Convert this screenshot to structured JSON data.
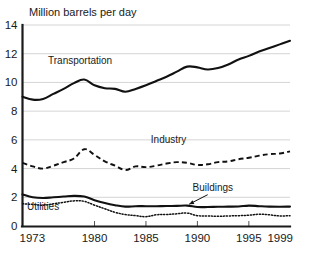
{
  "chart_data": {
    "type": "line",
    "title": "Million barrels per day",
    "xlabel": "",
    "ylabel": "Million barrels per day",
    "xlim": [
      1973,
      1999
    ],
    "ylim": [
      0,
      14
    ],
    "grid": true,
    "legend_position": "inline-annotations",
    "y_ticks": [
      "0",
      "2",
      "4",
      "6",
      "8",
      "10",
      "12",
      "14"
    ],
    "y_tick_values": [
      0,
      2,
      4,
      6,
      8,
      10,
      12,
      14
    ],
    "x_ticks": [
      "1973",
      "1980",
      "1985",
      "1990",
      "1995",
      "1999"
    ],
    "x_tick_values": [
      1973,
      1980,
      1985,
      1990,
      1995,
      1999
    ],
    "x": [
      1973,
      1974,
      1975,
      1976,
      1977,
      1978,
      1979,
      1980,
      1981,
      1982,
      1983,
      1984,
      1985,
      1986,
      1987,
      1988,
      1989,
      1990,
      1991,
      1992,
      1993,
      1994,
      1995,
      1996,
      1997,
      1998,
      1999
    ],
    "series": [
      {
        "name": "Transportation",
        "style": "solid",
        "label_x": 1978.6,
        "label_y": 11.25,
        "values": [
          9.0,
          8.8,
          8.85,
          9.2,
          9.55,
          9.95,
          10.2,
          9.8,
          9.6,
          9.55,
          9.35,
          9.55,
          9.8,
          10.1,
          10.4,
          10.75,
          11.1,
          11.05,
          10.9,
          11.0,
          11.25,
          11.6,
          11.85,
          12.15,
          12.4,
          12.65,
          12.9
        ]
      },
      {
        "name": "Industry",
        "style": "dashed",
        "label_x": 1987.2,
        "label_y": 5.75,
        "values": [
          4.4,
          4.15,
          4.0,
          4.2,
          4.45,
          4.7,
          5.35,
          4.95,
          4.5,
          4.2,
          3.9,
          4.15,
          4.1,
          4.2,
          4.35,
          4.45,
          4.4,
          4.25,
          4.3,
          4.45,
          4.5,
          4.65,
          4.75,
          4.9,
          5.0,
          5.05,
          5.2
        ]
      },
      {
        "name": "Buildings",
        "style": "solid",
        "label_x": 1991.5,
        "label_y": 2.45,
        "values": [
          2.2,
          2.0,
          1.95,
          2.0,
          2.05,
          2.1,
          2.05,
          1.8,
          1.6,
          1.45,
          1.35,
          1.38,
          1.38,
          1.38,
          1.39,
          1.4,
          1.42,
          1.32,
          1.32,
          1.34,
          1.35,
          1.36,
          1.42,
          1.38,
          1.35,
          1.34,
          1.35
        ]
      },
      {
        "name": "Utilities",
        "style": "dotted",
        "label_x": 1975.0,
        "label_y": 1.08,
        "values": [
          1.55,
          1.5,
          1.45,
          1.55,
          1.65,
          1.75,
          1.72,
          1.45,
          1.2,
          0.95,
          0.8,
          0.72,
          0.65,
          0.78,
          0.8,
          0.85,
          0.9,
          0.72,
          0.7,
          0.68,
          0.7,
          0.72,
          0.75,
          0.82,
          0.78,
          0.7,
          0.72
        ]
      }
    ],
    "annotations": [
      {
        "name": "buildings-callout-arrow",
        "from_x": 1991.0,
        "from_y": 2.18,
        "to_x": 1989.2,
        "to_y": 1.52
      }
    ],
    "colors": {
      "line": "#111111",
      "gridline": "#c9c9c9",
      "axis": "#1a1a1a",
      "background": "#ffffff"
    }
  }
}
